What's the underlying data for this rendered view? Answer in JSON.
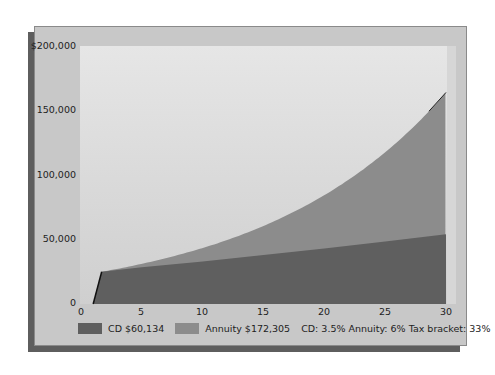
{
  "chart_data": {
    "type": "area",
    "title": "",
    "xlabel": "",
    "ylabel": "",
    "xlim": [
      0,
      30
    ],
    "ylim": [
      0,
      200000
    ],
    "x_ticks": [
      "0",
      "5",
      "10",
      "15",
      "20",
      "25",
      "30"
    ],
    "y_ticks": [
      "0",
      "50,000",
      "100,000",
      "150,000",
      "$200,000"
    ],
    "grid": false,
    "legend_position": "bottom",
    "x": [
      1,
      1.7,
      5,
      10,
      15,
      20,
      25,
      30
    ],
    "series": [
      {
        "name": "CD $60,134",
        "color": "#5f5f5f",
        "values": [
          0,
          25000,
          28500,
          33000,
          38000,
          43000,
          48500,
          54000
        ]
      },
      {
        "name": "Annuity $172,305",
        "color": "#8c8c8c",
        "values": [
          0,
          25000,
          31500,
          42000,
          56500,
          76000,
          104000,
          164000
        ]
      }
    ],
    "annotations": [
      "CD: 3.5% Annuity: 6% Tax bracket: 33%"
    ]
  },
  "axis": {
    "y": [
      "$200,000",
      "150,000",
      "100,000",
      "50,000",
      "0"
    ],
    "x": [
      "0",
      "5",
      "10",
      "15",
      "20",
      "25",
      "30"
    ]
  },
  "legend": {
    "cd_label": "CD $60,134",
    "cd_color": "#5f5f5f",
    "annuity_label": "Annuity $172,305",
    "annuity_color": "#8c8c8c",
    "note": "CD: 3.5% Annuity: 6% Tax bracket: 33%"
  }
}
